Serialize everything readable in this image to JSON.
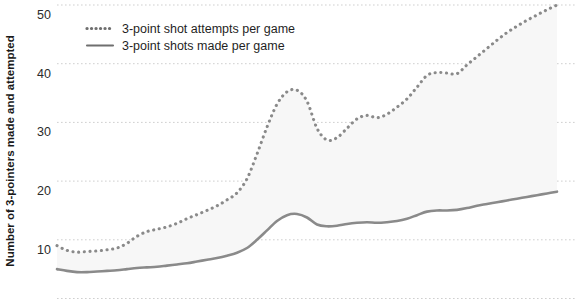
{
  "chart_data": {
    "type": "line",
    "title": "",
    "subtitle": "",
    "xlabel": "",
    "ylabel": "Number of 3-pointers made and attempted",
    "ylim": [
      0,
      52
    ],
    "yticks": [
      10,
      20,
      30,
      40,
      50
    ],
    "ytick_labels": [
      "10",
      "20",
      "30",
      "40",
      "50"
    ],
    "xlim": [
      0,
      40
    ],
    "xticks": [],
    "xtick_labels": [],
    "grid": "horizontal-dotted",
    "legend_position": "top-left",
    "area_fill_between_series": true,
    "x": [
      0,
      1,
      2,
      3,
      4,
      5,
      6,
      7,
      8,
      9,
      10,
      11,
      12,
      13,
      14,
      15,
      16,
      17,
      18,
      19,
      20,
      21,
      22,
      23,
      24,
      25,
      26,
      27,
      28,
      29,
      30,
      31,
      32,
      33,
      34,
      35,
      36,
      37,
      38,
      39,
      40
    ],
    "series": [
      {
        "name": "3-point shot attempts per game",
        "style": "dotted",
        "color": "#8a8a8a",
        "values": [
          9.0,
          8.2,
          7.9,
          8.0,
          8.1,
          8.3,
          8.6,
          9.4,
          10.6,
          11.4,
          11.8,
          12.2,
          12.8,
          13.6,
          14.3,
          15.0,
          15.8,
          16.8,
          18.0,
          20.4,
          24.6,
          29.2,
          33.1,
          35.2,
          35.5,
          33.6,
          29.0,
          27.0,
          27.4,
          29.0,
          30.6,
          31.2,
          30.8,
          31.4,
          32.6,
          34.0,
          36.0,
          38.0,
          38.5,
          38.4,
          38.3
        ]
      },
      {
        "name": "3-point shots made per game",
        "style": "solid",
        "color": "#8a8a8a",
        "values": [
          5.0,
          4.7,
          4.5,
          4.5,
          4.6,
          4.7,
          4.8,
          5.0,
          5.2,
          5.3,
          5.4,
          5.6,
          5.8,
          6.0,
          6.3,
          6.6,
          6.9,
          7.3,
          7.8,
          8.6,
          10.0,
          11.6,
          13.2,
          14.2,
          14.4,
          13.8,
          12.6,
          12.3,
          12.4,
          12.7,
          12.9,
          13.0,
          12.9,
          13.0,
          13.2,
          13.6,
          14.2,
          14.8,
          15.0,
          15.0,
          15.1
        ]
      }
    ],
    "series_tail": {
      "note_x": [
        41,
        42,
        43,
        44,
        45,
        46,
        47,
        48,
        49,
        50
      ],
      "attempts_tail": [
        39.8,
        41.2,
        42.6,
        44.0,
        45.3,
        46.4,
        47.4,
        48.3,
        49.2,
        50.0
      ],
      "made_tail": [
        15.4,
        15.8,
        16.1,
        16.4,
        16.7,
        17.0,
        17.3,
        17.6,
        17.9,
        18.2
      ]
    },
    "colors": {
      "line": "#8a8a8a",
      "fill": "#f7f7f7",
      "grid": "#cfcfcf",
      "text": "#1a1a1a",
      "background": "#ffffff"
    }
  },
  "legend": {
    "items": [
      {
        "label": "3-point shot attempts per game",
        "marker": "dotted-line-swatch"
      },
      {
        "label": "3-point shots made per game",
        "marker": "solid-line-swatch"
      }
    ]
  },
  "axes": {
    "y_axis_title": "Number of 3-pointers made and attempted",
    "y_tick_labels": [
      "50",
      "40",
      "30",
      "20",
      "10"
    ]
  }
}
